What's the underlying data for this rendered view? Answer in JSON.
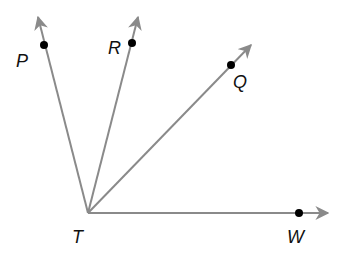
{
  "diagram": {
    "type": "rays-from-common-vertex",
    "vertex": {
      "label": "T",
      "x": 88,
      "y": 213
    },
    "ray_color": "#8a8a8a",
    "point_color": "#000000",
    "rays": [
      {
        "name": "TP",
        "label": "P",
        "tip": [
          38,
          17
        ],
        "point": [
          44,
          45
        ],
        "label_pos": [
          16,
          67
        ]
      },
      {
        "name": "TR",
        "label": "R",
        "tip": [
          138,
          17
        ],
        "point": [
          132,
          43
        ],
        "label_pos": [
          108,
          54
        ]
      },
      {
        "name": "TQ",
        "label": "Q",
        "tip": [
          251,
          45
        ],
        "point": [
          231,
          65
        ],
        "label_pos": [
          233,
          88
        ]
      },
      {
        "name": "TW",
        "label": "W",
        "tip": [
          328,
          213
        ],
        "point": [
          299,
          213
        ],
        "label_pos": [
          287,
          243
        ]
      }
    ],
    "vertex_label_pos": [
      72,
      243
    ]
  }
}
